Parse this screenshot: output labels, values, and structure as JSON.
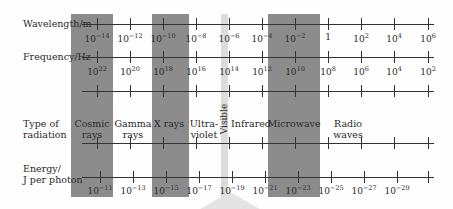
{
  "rows": {
    "wavelength": {
      "label": "Wavelength/m",
      "y": 24,
      "ticks": [
        [
          "10",
          "-14"
        ],
        [
          "10",
          "-12"
        ],
        [
          "10",
          "-10"
        ],
        [
          "10",
          "-8"
        ],
        [
          "10",
          "-6"
        ],
        [
          "10",
          "-4"
        ],
        [
          "10",
          "-2"
        ],
        [
          "1",
          ""
        ],
        [
          "10",
          "2"
        ],
        [
          "10",
          "4"
        ],
        [
          "10",
          "6"
        ]
      ]
    },
    "frequency": {
      "label": "Frequency/Hz",
      "y": 57,
      "ticks": [
        [
          "10",
          "22"
        ],
        [
          "10",
          "20"
        ],
        [
          "10",
          "18"
        ],
        [
          "10",
          "16"
        ],
        [
          "10",
          "14"
        ],
        [
          "10",
          "12"
        ],
        [
          "10",
          "10"
        ],
        [
          "10",
          "8"
        ],
        [
          "10",
          "6"
        ],
        [
          "10",
          "4"
        ],
        [
          "10",
          "2"
        ]
      ]
    },
    "type": {
      "label_line1": "Type of",
      "label_line2": "radiation"
    },
    "energy": {
      "label_line1": "Energy/",
      "label_line2": "J per photon",
      "y": 177,
      "ticks": [
        [
          "10",
          "-11"
        ],
        [
          "10",
          "-13"
        ],
        [
          "10",
          "-15"
        ],
        [
          "10",
          "-17"
        ],
        [
          "10",
          "-19"
        ],
        [
          "10",
          "-21"
        ],
        [
          "10",
          "-23"
        ],
        [
          "10",
          "-25"
        ],
        [
          "10",
          "-27"
        ],
        [
          "10",
          "-29"
        ]
      ]
    }
  },
  "regions": [
    {
      "name": "cosmic-rays",
      "line1": "Cosmic",
      "line2": "rays",
      "x": 92
    },
    {
      "name": "gamma-rays",
      "line1": "Gamma",
      "line2": "rays",
      "x": 133
    },
    {
      "name": "x-rays",
      "line1": "X rays",
      "line2": "",
      "x": 169
    },
    {
      "name": "ultraviolet",
      "line1": "Ultra-",
      "line2": "violet",
      "x": 204
    },
    {
      "name": "visible",
      "line1": "Visible",
      "line2": "",
      "x": 224
    },
    {
      "name": "infrared",
      "line1": "Infrared",
      "line2": "",
      "x": 251
    },
    {
      "name": "microwave",
      "line1": "Microwave",
      "line2": "",
      "x": 294
    },
    {
      "name": "radio-waves",
      "line1": "Radio",
      "line2": "waves",
      "x": 348
    }
  ],
  "colors": {
    "band_dark": "#8c8c8c",
    "band_visible": "#dcdcdc",
    "line": "#333333"
  }
}
